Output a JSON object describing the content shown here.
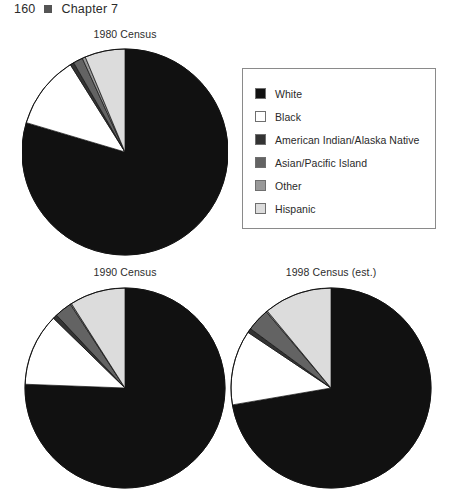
{
  "page_header": {
    "folio": "160",
    "bullet_icon": "square-bullet-icon",
    "chapter": "Chapter 7"
  },
  "legend": {
    "border_color": "#8a8a8a",
    "items": [
      {
        "label": "White",
        "color": "#111111"
      },
      {
        "label": "Black",
        "color": "#ffffff"
      },
      {
        "label": "American Indian/Alaska Native",
        "color": "#333333"
      },
      {
        "label": "Asian/Pacific Island",
        "color": "#636363"
      },
      {
        "label": "Other",
        "color": "#999999"
      },
      {
        "label": "Hispanic",
        "color": "#dcdcdc"
      }
    ]
  },
  "chart_data": [
    {
      "type": "pie",
      "title": "1980 Census",
      "labels": [
        "White",
        "Black",
        "American Indian/Alaska Native",
        "Asian/Pacific Island",
        "Other",
        "Hispanic"
      ],
      "values": [
        79.6,
        11.5,
        0.6,
        1.5,
        0.5,
        6.3
      ],
      "colors": [
        "#111111",
        "#ffffff",
        "#333333",
        "#636363",
        "#999999",
        "#dcdcdc"
      ],
      "start_angle": 0,
      "direction": "clockwise",
      "radius": 103,
      "legend_position": "right"
    },
    {
      "type": "pie",
      "title": "1990 Census",
      "labels": [
        "White",
        "Black",
        "American Indian/Alaska Native",
        "Asian/Pacific Island",
        "Other",
        "Hispanic"
      ],
      "values": [
        75.6,
        11.7,
        0.7,
        2.8,
        0.2,
        9.0
      ],
      "colors": [
        "#111111",
        "#ffffff",
        "#333333",
        "#636363",
        "#999999",
        "#dcdcdc"
      ],
      "start_angle": 0,
      "direction": "clockwise",
      "radius": 100,
      "legend_position": "shared"
    },
    {
      "type": "pie",
      "title": "1998 Census (est.)",
      "labels": [
        "White",
        "Black",
        "American Indian/Alaska Native",
        "Asian/Pacific Island",
        "Other",
        "Hispanic"
      ],
      "values": [
        72.3,
        12.1,
        0.7,
        3.7,
        0.2,
        11.0
      ],
      "colors": [
        "#111111",
        "#ffffff",
        "#333333",
        "#636363",
        "#999999",
        "#dcdcdc"
      ],
      "start_angle": 0,
      "direction": "clockwise",
      "radius": 100,
      "legend_position": "shared"
    }
  ]
}
